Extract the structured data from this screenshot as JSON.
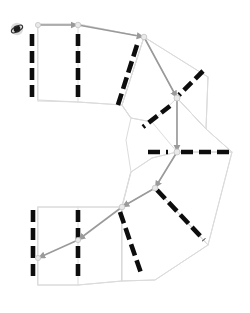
{
  "canvas": {
    "width": 250,
    "height": 313,
    "background": "#ffffff"
  },
  "view": {
    "title": "Parking Lot Route Map",
    "description": "Horseshoe-shaped parking lot with dashed stall dividers and a highlighted driving route"
  },
  "colors": {
    "background": "#ffffff",
    "lot_outline": "#d8d8d8",
    "lane_line": "#dcdcdc",
    "stall_divider": "#0d0d0d",
    "route": "#9a9a9a",
    "route_node_fill": "#e9e9e9",
    "origin_marker": "#1a1a1a"
  },
  "origin_marker": {
    "label": "start-position-marker",
    "x": 17,
    "y": 29,
    "radius": 3.4,
    "halo_radius": 6.2
  },
  "lot_outline": {
    "label": "parking-lot-boundary",
    "points": "38,24 78,24 144,37 177,98 177,152 232,152 208,205 155,188 155,188 122,207 78,207 38,207 38,285 78,285 122,281 155,249 208,245 232,152"
  },
  "lot_polygons": [
    {
      "name": "upper-lot-block",
      "points": "38,24 78,24 144,37 122,105 78,102 38,100"
    },
    {
      "name": "upper-inner-block",
      "points": "122,105 144,37 177,98 152,122 131,118"
    },
    {
      "name": "right-upper-block",
      "points": "144,37 208,77 206,129 177,98"
    },
    {
      "name": "right-mid-block",
      "points": "177,98 206,129 232,152 177,152"
    },
    {
      "name": "right-lower-block",
      "points": "177,152 232,152 208,245 155,188"
    },
    {
      "name": "lower-inner-block",
      "points": "131,172 152,158 177,152 155,188 122,207"
    },
    {
      "name": "lower-lot-block",
      "points": "38,207 78,207 122,207 122,281 78,285 38,285"
    },
    {
      "name": "lower-outer-block",
      "points": "122,207 155,188 208,245 155,280 122,281"
    }
  ],
  "lane_lines": [
    {
      "name": "lane-top-edge",
      "points": "38,24 78,24 144,37"
    },
    {
      "name": "lane-upper-left-bottom",
      "points": "38,101 78,102 122,105"
    },
    {
      "name": "lane-upper-mid-divider",
      "points": "78,24 78,102"
    },
    {
      "name": "lane-left-edge-upper",
      "points": "38,24 38,101"
    },
    {
      "name": "lane-upper-diagonal",
      "points": "122,105 144,37"
    },
    {
      "name": "lane-core-upper-left",
      "points": "122,105 131,118 152,122"
    },
    {
      "name": "lane-core-upper-right",
      "points": "144,37 177,98"
    },
    {
      "name": "lane-right-upper-outer",
      "points": "144,37 208,77"
    },
    {
      "name": "lane-right-outer-1",
      "points": "208,77 206,129 232,152"
    },
    {
      "name": "lane-right-mid",
      "points": "177,98 206,129"
    },
    {
      "name": "lane-right-lower-outer",
      "points": "232,152 208,245"
    },
    {
      "name": "lane-core-lower-right",
      "points": "177,152 155,188"
    },
    {
      "name": "lane-core-lower-left",
      "points": "152,158 131,172 122,207"
    },
    {
      "name": "lane-lower-diagonal",
      "points": "155,188 208,245"
    },
    {
      "name": "lane-lower-left-top",
      "points": "38,207 78,207 122,207"
    },
    {
      "name": "lane-lower-left-bottom",
      "points": "38,285 78,285 122,281"
    },
    {
      "name": "lane-left-edge-lower",
      "points": "38,207 38,285"
    },
    {
      "name": "lane-lower-mid-divider",
      "points": "78,207 78,285"
    },
    {
      "name": "lane-lower-outer-bottom",
      "points": "122,281 155,280 208,245"
    },
    {
      "name": "lane-inner-curve-upper",
      "points": "122,105 131,118"
    },
    {
      "name": "lane-inner-curve-lower",
      "points": "131,172 122,207"
    },
    {
      "name": "lane-inner-arc",
      "points": "131,118 126,140 131,172"
    },
    {
      "name": "lane-core-vertical",
      "points": "177,98 177,152"
    },
    {
      "name": "lane-core-crossbar",
      "points": "152,122 177,152 152,158"
    }
  ],
  "stall_rows": [
    {
      "name": "stall-row-upper-left-column-1",
      "orientation": "vertical",
      "x1": 32,
      "y1": 34,
      "x2": 32,
      "y2": 98,
      "dash_pattern": "12 5",
      "stall_count": 4
    },
    {
      "name": "stall-row-upper-left-column-2",
      "orientation": "vertical",
      "x1": 78,
      "y1": 34,
      "x2": 78,
      "y2": 99,
      "dash_pattern": "12 5",
      "stall_count": 4
    },
    {
      "name": "stall-row-upper-diagonal-inner",
      "orientation": "diagonal",
      "x1": 137,
      "y1": 45,
      "x2": 117,
      "y2": 108,
      "dash_pattern": "12 5",
      "stall_count": 4
    },
    {
      "name": "stall-row-upper-core-diagonal",
      "orientation": "diagonal",
      "x1": 203,
      "y1": 71,
      "x2": 179,
      "y2": 95,
      "dash_pattern": "11 5",
      "stall_count": 2
    },
    {
      "name": "stall-row-mid-core-diagonal",
      "orientation": "diagonal",
      "x1": 170,
      "y1": 106,
      "x2": 143,
      "y2": 127,
      "dash_pattern": "11 5",
      "stall_count": 2
    },
    {
      "name": "stall-row-center-left-horizontal",
      "orientation": "horizontal",
      "x1": 148,
      "y1": 152,
      "x2": 168,
      "y2": 152,
      "dash_pattern": "12 6",
      "stall_count": 1
    },
    {
      "name": "stall-row-center-right-horizontal",
      "orientation": "horizontal",
      "x1": 181,
      "y1": 152,
      "x2": 231,
      "y2": 152,
      "dash_pattern": "12 6",
      "stall_count": 3
    },
    {
      "name": "stall-row-lower-core-diagonal",
      "orientation": "diagonal",
      "x1": 157,
      "y1": 190,
      "x2": 204,
      "y2": 240,
      "dash_pattern": "12 5",
      "stall_count": 4
    },
    {
      "name": "stall-row-lower-diagonal-inner",
      "orientation": "diagonal",
      "x1": 120,
      "y1": 212,
      "x2": 142,
      "y2": 276,
      "dash_pattern": "12 5",
      "stall_count": 4
    },
    {
      "name": "stall-row-lower-left-column-2",
      "orientation": "vertical",
      "x1": 78,
      "y1": 210,
      "x2": 78,
      "y2": 282,
      "dash_pattern": "12 6",
      "stall_count": 4
    },
    {
      "name": "stall-row-lower-left-column-1",
      "orientation": "vertical",
      "x1": 33,
      "y1": 210,
      "x2": 33,
      "y2": 282,
      "dash_pattern": "12 6",
      "stall_count": 4
    }
  ],
  "route": {
    "name": "driving-route",
    "segments": [
      {
        "name": "route-segment-1",
        "from": "38,25",
        "to": "78,25",
        "arrow": true
      },
      {
        "name": "route-segment-2",
        "from": "78,25",
        "to": "144,37",
        "arrow": true
      },
      {
        "name": "route-segment-3",
        "from": "144,37",
        "to": "177,98",
        "arrow": true
      },
      {
        "name": "route-segment-4",
        "from": "177,98",
        "to": "177,152",
        "arrow": true
      },
      {
        "name": "route-segment-5",
        "from": "177,152",
        "to": "155,188",
        "arrow": true
      },
      {
        "name": "route-segment-6",
        "from": "155,188",
        "to": "122,207",
        "arrow": true
      },
      {
        "name": "route-segment-7",
        "from": "122,207",
        "to": "78,240",
        "arrow": true
      },
      {
        "name": "route-segment-8",
        "from": "78,240",
        "to": "38,258",
        "arrow": true
      }
    ],
    "nodes": [
      {
        "name": "route-node-start",
        "x": 38,
        "y": 25,
        "r": 2.6
      },
      {
        "name": "route-node-a",
        "x": 78,
        "y": 25,
        "r": 2.8
      },
      {
        "name": "route-node-b",
        "x": 144,
        "y": 37,
        "r": 2.8
      },
      {
        "name": "route-node-c",
        "x": 177,
        "y": 98,
        "r": 3.0
      },
      {
        "name": "route-node-d",
        "x": 177,
        "y": 152,
        "r": 3.0
      },
      {
        "name": "route-node-e",
        "x": 155,
        "y": 188,
        "r": 2.8
      },
      {
        "name": "route-node-f",
        "x": 122,
        "y": 207,
        "r": 2.8
      },
      {
        "name": "route-node-g",
        "x": 78,
        "y": 240,
        "r": 2.6
      },
      {
        "name": "route-node-end",
        "x": 38,
        "y": 258,
        "r": 2.6
      }
    ]
  }
}
